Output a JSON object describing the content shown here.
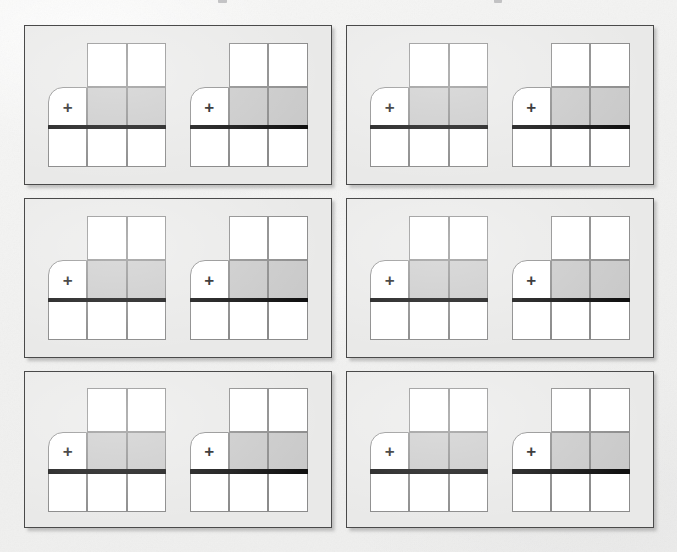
{
  "page": {
    "background_color": "#f2f2f1",
    "width": 677,
    "height": 552,
    "media": "scanned-paper"
  },
  "top_cutoff_text": {
    "visible": true,
    "legible": false,
    "description": "bottom sliver of a cut-off line of text above the figure",
    "fragments": [
      {
        "left": 218,
        "width": 9
      },
      {
        "left": 494,
        "width": 8
      }
    ]
  },
  "colors": {
    "panel_fill": "#e9e9e8",
    "panel_border": "#4a4a4a",
    "cell_fill": "#ffffff",
    "cell_shaded_fill": "#c9c9c9",
    "cell_border": "#8b8b8b",
    "thick_line": "#111111",
    "plus_glyph": "#1a1a1a"
  },
  "diagram_template": {
    "name": "notched-grid-with-baseline",
    "columns": 3,
    "rows": 3,
    "plus_symbol": "+",
    "cells": [
      {
        "id": "r1c1",
        "row": 1,
        "col": 1,
        "present": false,
        "fill": "none",
        "rounded": false,
        "label": ""
      },
      {
        "id": "r1c2",
        "row": 1,
        "col": 2,
        "present": true,
        "fill": "white",
        "rounded": false,
        "label": ""
      },
      {
        "id": "r1c3",
        "row": 1,
        "col": 3,
        "present": true,
        "fill": "white",
        "rounded": false,
        "label": ""
      },
      {
        "id": "r2c1",
        "row": 2,
        "col": 1,
        "present": true,
        "fill": "white",
        "rounded": true,
        "label": "+"
      },
      {
        "id": "r2c2",
        "row": 2,
        "col": 2,
        "present": true,
        "fill": "shaded",
        "rounded": false,
        "label": ""
      },
      {
        "id": "r2c3",
        "row": 2,
        "col": 3,
        "present": true,
        "fill": "shaded",
        "rounded": false,
        "label": ""
      },
      {
        "id": "r3c1",
        "row": 3,
        "col": 1,
        "present": true,
        "fill": "white",
        "rounded": false,
        "label": ""
      },
      {
        "id": "r3c2",
        "row": 3,
        "col": 2,
        "present": true,
        "fill": "white",
        "rounded": false,
        "label": ""
      },
      {
        "id": "r3c3",
        "row": 3,
        "col": 3,
        "present": true,
        "fill": "white",
        "rounded": false,
        "label": ""
      }
    ],
    "baseline": {
      "present": true,
      "after_row": 2,
      "spans_full_width": true,
      "thickness_px": 4.5
    }
  },
  "panels": [
    {
      "id": "panel-1",
      "position": "row1-col1",
      "diagrams": [
        {
          "id": "panel-1-diagram-1",
          "plus_symbol": "+"
        },
        {
          "id": "panel-1-diagram-2",
          "plus_symbol": "+"
        }
      ]
    },
    {
      "id": "panel-2",
      "position": "row1-col2",
      "diagrams": [
        {
          "id": "panel-2-diagram-1",
          "plus_symbol": "+"
        },
        {
          "id": "panel-2-diagram-2",
          "plus_symbol": "+"
        }
      ]
    },
    {
      "id": "panel-3",
      "position": "row2-col1",
      "diagrams": [
        {
          "id": "panel-3-diagram-1",
          "plus_symbol": "+"
        },
        {
          "id": "panel-3-diagram-2",
          "plus_symbol": "+"
        }
      ]
    },
    {
      "id": "panel-4",
      "position": "row2-col2",
      "diagrams": [
        {
          "id": "panel-4-diagram-1",
          "plus_symbol": "+"
        },
        {
          "id": "panel-4-diagram-2",
          "plus_symbol": "+"
        }
      ]
    },
    {
      "id": "panel-5",
      "position": "row3-col1",
      "diagrams": [
        {
          "id": "panel-5-diagram-1",
          "plus_symbol": "+"
        },
        {
          "id": "panel-5-diagram-2",
          "plus_symbol": "+"
        }
      ]
    },
    {
      "id": "panel-6",
      "position": "row3-col2",
      "diagrams": [
        {
          "id": "panel-6-diagram-1",
          "plus_symbol": "+"
        },
        {
          "id": "panel-6-diagram-2",
          "plus_symbol": "+"
        }
      ]
    }
  ]
}
